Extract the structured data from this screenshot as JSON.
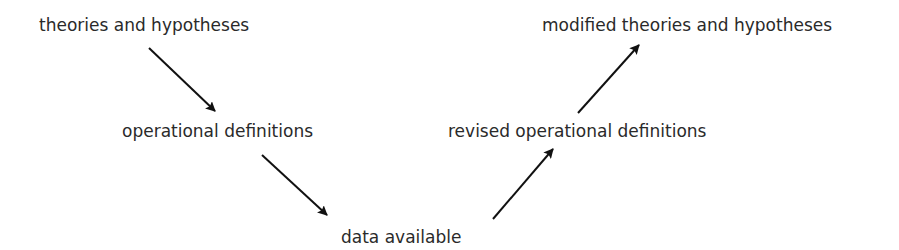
{
  "diagram": {
    "nodes": [
      {
        "id": "theories",
        "label": "theories and hypotheses",
        "x": 39,
        "y": 15
      },
      {
        "id": "operational",
        "label": "operational definitions",
        "x": 122,
        "y": 121
      },
      {
        "id": "data",
        "label": "data available",
        "x": 341,
        "y": 227
      },
      {
        "id": "revised",
        "label": "revised operational definitions",
        "x": 448,
        "y": 121
      },
      {
        "id": "modified",
        "label": "modified theories and hypotheses",
        "x": 542,
        "y": 15
      }
    ],
    "edges": [
      {
        "from": "theories",
        "to": "operational"
      },
      {
        "from": "operational",
        "to": "data"
      },
      {
        "from": "data",
        "to": "revised"
      },
      {
        "from": "revised",
        "to": "modified"
      }
    ],
    "colors": {
      "text": "#2a2a2a",
      "arrow": "#111111",
      "background": "#ffffff"
    }
  }
}
